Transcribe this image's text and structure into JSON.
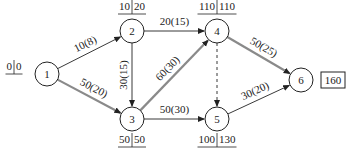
{
  "diagram": {
    "type": "activity-on-arrow network (critical path)",
    "nodes": [
      {
        "id": "1",
        "label": "1",
        "x": 47,
        "y": 74,
        "et": "0",
        "lt": "0",
        "times_pos": "left"
      },
      {
        "id": "2",
        "label": "2",
        "x": 132,
        "y": 31,
        "et": "10",
        "lt": "20",
        "times_pos": "top"
      },
      {
        "id": "3",
        "label": "3",
        "x": 132,
        "y": 119,
        "et": "50",
        "lt": "50",
        "times_pos": "bottom"
      },
      {
        "id": "4",
        "label": "4",
        "x": 217,
        "y": 31,
        "et": "110",
        "lt": "110",
        "times_pos": "top"
      },
      {
        "id": "5",
        "label": "5",
        "x": 217,
        "y": 119,
        "et": "100",
        "lt": "130",
        "times_pos": "bottom"
      },
      {
        "id": "6",
        "label": "6",
        "x": 301,
        "y": 80,
        "et": "",
        "lt": "",
        "times_pos": "none"
      }
    ],
    "edges": [
      {
        "from": "1",
        "to": "2",
        "label": "10(8)",
        "critical": false,
        "dashed": false
      },
      {
        "from": "1",
        "to": "3",
        "label": "50(20)",
        "critical": true,
        "dashed": false
      },
      {
        "from": "2",
        "to": "3",
        "label": "30(15)",
        "critical": false,
        "dashed": false
      },
      {
        "from": "2",
        "to": "4",
        "label": "20(15)",
        "critical": false,
        "dashed": false
      },
      {
        "from": "3",
        "to": "4",
        "label": "60(30)",
        "critical": true,
        "dashed": false
      },
      {
        "from": "3",
        "to": "5",
        "label": "50(30)",
        "critical": false,
        "dashed": false
      },
      {
        "from": "4",
        "to": "5",
        "label": "",
        "critical": false,
        "dashed": true
      },
      {
        "from": "4",
        "to": "6",
        "label": "50(25)",
        "critical": true,
        "dashed": false
      },
      {
        "from": "5",
        "to": "6",
        "label": "30(20)",
        "critical": false,
        "dashed": false
      }
    ],
    "total_duration": "160",
    "colors": {
      "critical": "#8a8a8a",
      "normal": "#222222",
      "node_stroke": "#222222"
    }
  }
}
